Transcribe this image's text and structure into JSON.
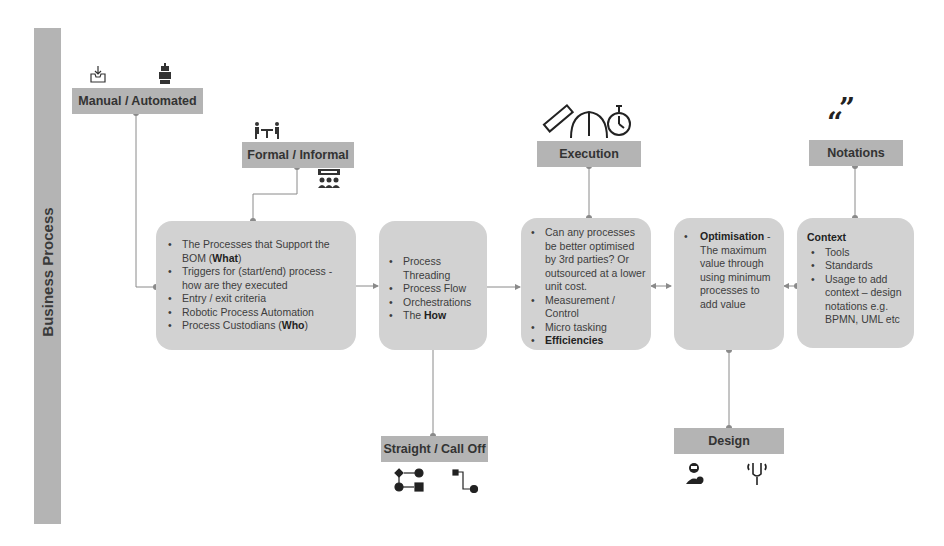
{
  "sidebar": {
    "title": "Business Process"
  },
  "labels": {
    "manual_automated": "Manual / Automated",
    "formal_informal": "Formal / Informal",
    "execution": "Execution",
    "notations": "Notations",
    "straight_call_off": "Straight / Call Off",
    "design": "Design"
  },
  "cards": {
    "what": {
      "items": [
        {
          "text": "The Processes that Support the BOM (",
          "bold": "What",
          "tail": ")"
        },
        {
          "text": "Triggers for (start/end) process - how are they executed"
        },
        {
          "text": "Entry / exit criteria"
        },
        {
          "text": "Robotic Process Automation"
        },
        {
          "text": "Process Custodians (",
          "bold": "Who",
          "tail": ")"
        }
      ]
    },
    "how": {
      "items": [
        {
          "text": "Process Threading"
        },
        {
          "text": "Process Flow"
        },
        {
          "text": "Orchestrations"
        },
        {
          "text": "The ",
          "bold": "How"
        }
      ]
    },
    "execution": {
      "items": [
        {
          "text": "Can any processes be better optimised by 3rd parties? Or outsourced at a lower unit cost."
        },
        {
          "text": "Measurement / Control"
        },
        {
          "text": "Micro tasking"
        },
        {
          "bold": "Efficiencies"
        }
      ]
    },
    "optimisation": {
      "items": [
        {
          "bold": "Optimisation",
          "tail": " - The maximum value through using minimum processes to add value"
        }
      ]
    },
    "context": {
      "title": "Context",
      "items": [
        {
          "text": "Tools"
        },
        {
          "text": "Standards"
        },
        {
          "text": "Usage to add context – design notations e.g. BPMN, UML etc"
        }
      ]
    }
  },
  "icons": [
    "inbox-download-icon",
    "robot-icon",
    "meeting-icon",
    "presentation-audience-icon",
    "ruler-icon",
    "gauge-icon",
    "stopwatch-icon",
    "quote-icon",
    "flow-sequence-icon",
    "flow-calloff-icon",
    "designer-icon",
    "tuning-fork-icon"
  ],
  "colors": {
    "box": "#b4b4b4",
    "card": "#d2d2d2",
    "line": "#8a8a8a"
  }
}
